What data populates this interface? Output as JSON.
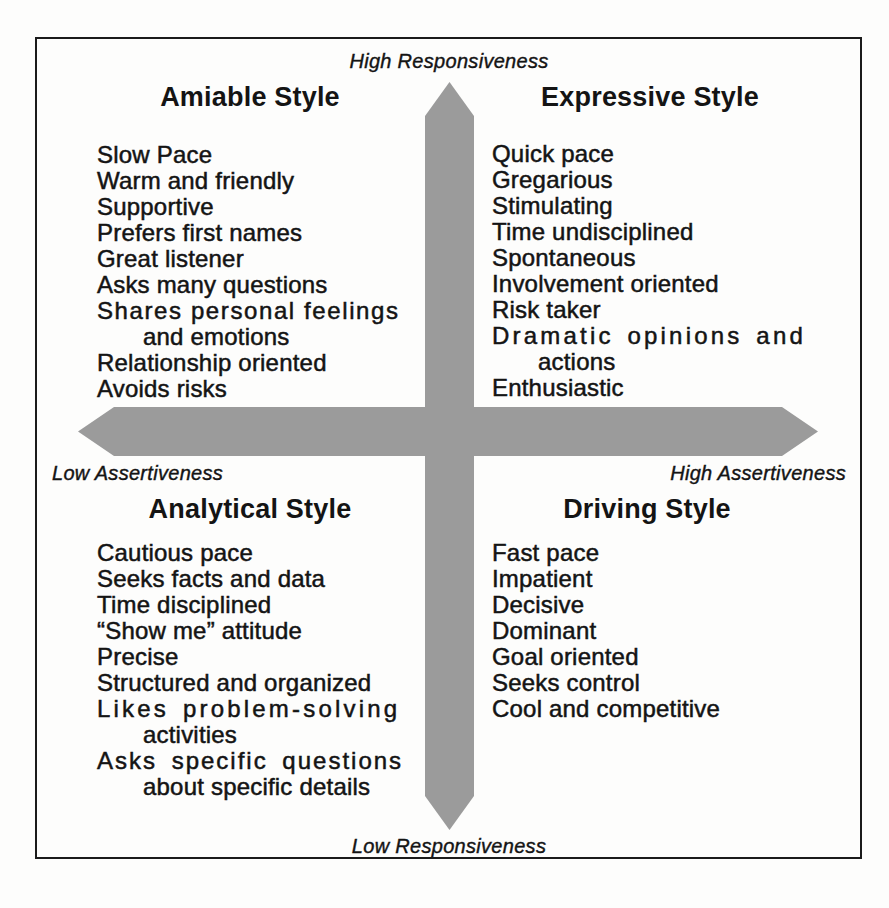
{
  "figure": {
    "type": "2x2-social-styles-matrix"
  },
  "axes": {
    "top_label": "High Responsiveness",
    "bottom_label": "Low Responsiveness",
    "left_label": "Low Assertiveness",
    "right_label": "High Assertiveness"
  },
  "colors": {
    "cross_gray": "#9b9b9b",
    "border": "#1b1b1b",
    "text": "#141414",
    "background": "#fdfdfc"
  },
  "quadrants": {
    "amiable": {
      "title": "Amiable Style",
      "lines": [
        "Slow Pace",
        "Warm and friendly",
        "Supportive",
        "Prefers first names",
        "Great listener",
        "Asks many questions",
        "Shares personal feelings",
        "and emotions",
        "Relationship oriented",
        "Avoids risks"
      ]
    },
    "expressive": {
      "title": "Expressive Style",
      "lines": [
        "Quick pace",
        "Gregarious",
        "Stimulating",
        "Time undisciplined",
        "Spontaneous",
        "Involvement oriented",
        "Risk taker",
        "Dramatic opinions and",
        "actions",
        "Enthusiastic"
      ]
    },
    "analytical": {
      "title": "Analytical Style",
      "lines": [
        "Cautious pace",
        "Seeks facts and data",
        "Time disciplined",
        "“Show me” attitude",
        "Precise",
        "Structured and organized",
        "Likes problem-solving",
        "activities",
        "Asks specific questions",
        "about specific details"
      ]
    },
    "driving": {
      "title": "Driving Style",
      "lines": [
        "Fast pace",
        "Impatient",
        "Decisive",
        "Dominant",
        "Goal oriented",
        "Seeks control",
        "Cool and competitive"
      ]
    }
  }
}
